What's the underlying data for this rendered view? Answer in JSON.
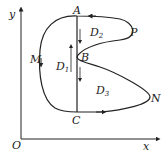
{
  "axes": {
    "x_label": "x",
    "y_label": "y",
    "origin_label": "O"
  },
  "points": {
    "A": "A",
    "B": "B",
    "C": "C",
    "M": "M",
    "N": "N",
    "P": "P"
  },
  "regions": {
    "D1": {
      "letter": "D",
      "sub": "1"
    },
    "D2": {
      "letter": "D",
      "sub": "2"
    },
    "D3": {
      "letter": "D",
      "sub": "3"
    }
  },
  "colors": {
    "stroke": "#222222",
    "background": "#ffffff"
  }
}
